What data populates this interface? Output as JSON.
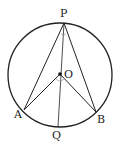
{
  "diagram": {
    "labels": {
      "P": "P",
      "O": "O",
      "A": "A",
      "B": "B",
      "Q": "Q"
    },
    "colors": {
      "stroke": "#222222",
      "angle_mark": "#999999",
      "background": "#ffffff"
    }
  }
}
